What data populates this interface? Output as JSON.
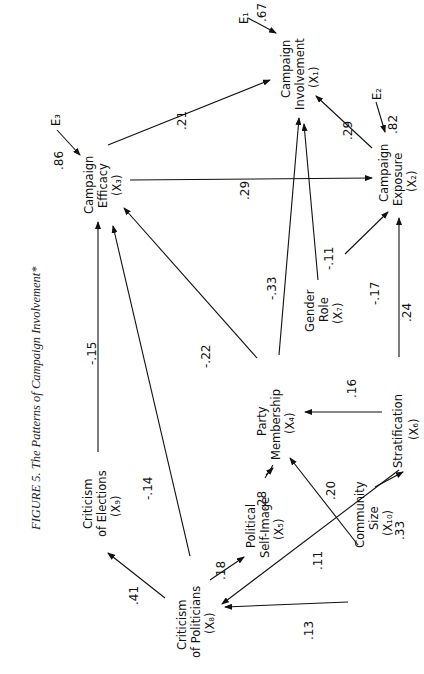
{
  "figure": {
    "title": "FIGURE 5. The Patterns of Campaign Involvement*",
    "orientation": "rotated 90° counter-clockwise"
  },
  "nodes": {
    "x1": {
      "line1": "Campaign",
      "line2": "Involvement",
      "var": "(X₁)"
    },
    "x2": {
      "line1": "Campaign",
      "line2": "Exposure",
      "var": "(X₂)"
    },
    "x3": {
      "line1": "Campaign",
      "line2": "Efficacy",
      "var": "(X₃)"
    },
    "x4": {
      "line1": "Party",
      "line2": "Membership",
      "var": "(X₄)"
    },
    "x5": {
      "line1": "Political",
      "line2": "Self-Image",
      "var": "(X₅)"
    },
    "x6": {
      "line1": "Stratification",
      "line2": "",
      "var": "(X₆)"
    },
    "x7": {
      "line1": "Gender",
      "line2": "Role",
      "var": "(X₇)"
    },
    "x8": {
      "line1": "Criticism",
      "line2": "of Politicians",
      "var": "(X₈)"
    },
    "x9": {
      "line1": "Criticism",
      "line2": "of Elections",
      "var": "(X₉)"
    },
    "x10": {
      "line1": "Community",
      "line2": "Size",
      "var": "(X₁₀)"
    }
  },
  "errors": {
    "e1": {
      "label": "E₁",
      "coef": ".67"
    },
    "e2": {
      "label": "E₂",
      "coef": ".82"
    },
    "e3": {
      "label": "E₃",
      "coef": ".86"
    }
  },
  "paths": {
    "x3_x1": ".21",
    "x3_x2": ".29",
    "x2_x1": ".29",
    "x4_x1": "-.33",
    "x7_x1": "-.11",
    "x7_x2": "-.17",
    "x6_x2": ".24",
    "x4_x3": "-.22",
    "x9_x3": "-.15",
    "x8_x3": "-.14",
    "x6_x4": ".16",
    "x5_x4": ".28",
    "x10_x4": ".20",
    "x10_x6": ".33",
    "x6_x8": ".11",
    "x10_x8": ".13",
    "x8_x5": ".18",
    "x8_x9": ".41"
  }
}
